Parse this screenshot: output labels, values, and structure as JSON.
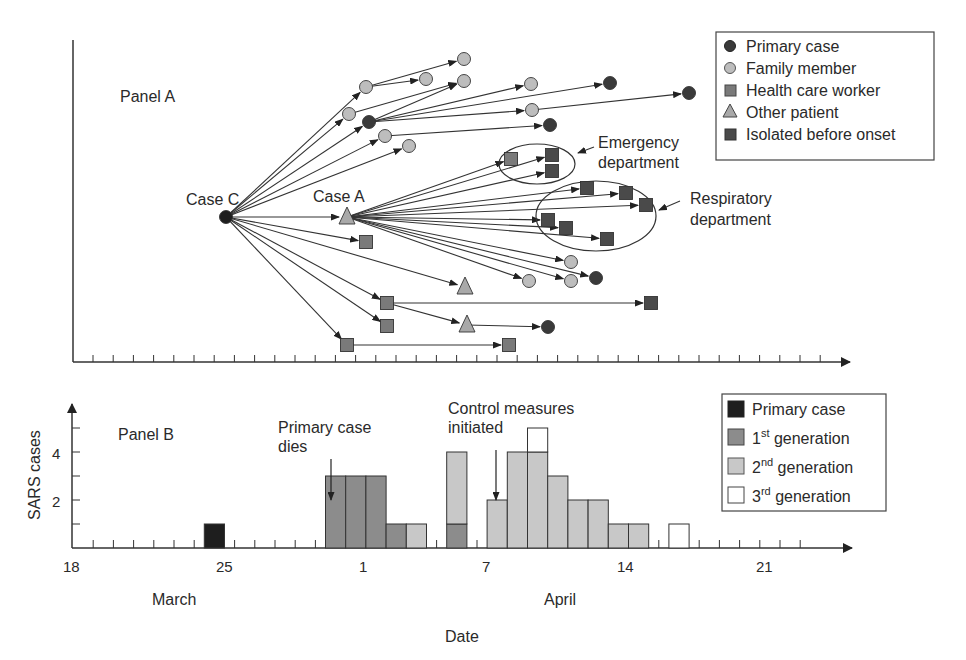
{
  "panel_a": {
    "title": "Panel A",
    "case_c_label": "Case C",
    "case_a_label": "Case A",
    "emergency_label_1": "Emergency",
    "emergency_label_2": "department",
    "respiratory_label_1": "Respiratory",
    "respiratory_label_2": "department",
    "legend": [
      {
        "label": "Primary case",
        "shape": "circle",
        "color": "#3a3a3a"
      },
      {
        "label": "Family member",
        "shape": "circle",
        "color": "#bdbdbd"
      },
      {
        "label": "Health care worker",
        "shape": "square",
        "color": "#7a7a7a"
      },
      {
        "label": "Other patient",
        "shape": "triangle",
        "color": "#a9a9a9"
      },
      {
        "label": "Isolated before onset",
        "shape": "square",
        "color": "#4a4a4a"
      }
    ]
  },
  "panel_b": {
    "title": "Panel B",
    "annotation_primary_dies_1": "Primary case",
    "annotation_primary_dies_2": "dies",
    "annotation_control_1": "Control measures",
    "annotation_control_2": "initiated",
    "legend": [
      {
        "label": "Primary case",
        "sup": "",
        "suffix": "",
        "color": "#1e1e1e"
      },
      {
        "label": "1",
        "sup": "st",
        "suffix": " generation",
        "color": "#8c8c8c"
      },
      {
        "label": "2",
        "sup": "nd",
        "suffix": " generation",
        "color": "#c8c8c8"
      },
      {
        "label": "3",
        "sup": "rd",
        "suffix": " generation",
        "color": "#ffffff"
      }
    ],
    "x_tick_labels": [
      "18",
      "25",
      "1",
      "7",
      "14",
      "21"
    ],
    "month_labels": [
      "March",
      "April"
    ],
    "ylabel": "SARS cases",
    "xlabel": "Date",
    "y_tick_labels": [
      "2",
      "4"
    ]
  },
  "chart_data": [
    {
      "type": "diagram",
      "title": "Panel A",
      "description": "Transmission tree of SARS cases from Case C over time (x-axis: date, 1 tick per day)",
      "legend": [
        "Primary case",
        "Family member",
        "Health care worker",
        "Other patient",
        "Isolated before onset"
      ],
      "nodes": [
        {
          "id": "C",
          "label": "Case C",
          "type": "Primary case"
        },
        {
          "id": "A",
          "label": "Case A",
          "type": "Other patient"
        }
      ],
      "groups": [
        "Emergency department",
        "Respiratory department"
      ]
    },
    {
      "type": "bar",
      "title": "Panel B",
      "xlabel": "Date",
      "ylabel": "SARS cases",
      "stacked": true,
      "categories": [
        "Mar 25",
        "Mar 31",
        "Apr 1",
        "Apr 2",
        "Apr 3",
        "Apr 4",
        "Apr 6",
        "Apr 8",
        "Apr 9",
        "Apr 10",
        "Apr 11",
        "Apr 12",
        "Apr 13",
        "Apr 14",
        "Apr 15",
        "Apr 17"
      ],
      "series": [
        {
          "name": "Primary case",
          "values": [
            1,
            0,
            0,
            0,
            0,
            0,
            0,
            0,
            0,
            0,
            0,
            0,
            0,
            0,
            0,
            0
          ]
        },
        {
          "name": "1st generation",
          "values": [
            0,
            3,
            3,
            3,
            1,
            0,
            1,
            0,
            0,
            0,
            0,
            0,
            0,
            0,
            0,
            0
          ]
        },
        {
          "name": "2nd generation",
          "values": [
            0,
            0,
            0,
            0,
            0,
            1,
            3,
            2,
            4,
            4,
            3,
            2,
            2,
            1,
            1,
            0
          ]
        },
        {
          "name": "3rd generation",
          "values": [
            0,
            0,
            0,
            0,
            0,
            0,
            0,
            0,
            0,
            1,
            0,
            0,
            0,
            0,
            0,
            1
          ]
        }
      ],
      "x_tick_labels": [
        "18",
        "25",
        "1",
        "7",
        "14",
        "21"
      ],
      "month_labels": [
        "March",
        "April"
      ],
      "y_tick_labels": [
        "2",
        "4"
      ],
      "ylim": [
        0,
        5
      ],
      "annotations": [
        {
          "text": "Primary case dies",
          "date": "Mar 31"
        },
        {
          "text": "Control measures initiated",
          "date": "Apr 7"
        }
      ],
      "legend_position": "upper right",
      "grid": false
    }
  ]
}
